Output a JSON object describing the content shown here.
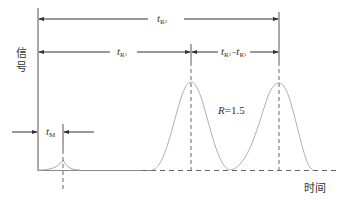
{
  "diagram": {
    "y_axis_label_line1": "信",
    "y_axis_label_line2": "号",
    "x_axis_label": "时间",
    "labels": {
      "tR2": {
        "main": "t",
        "sub": "R",
        "subsub": "2"
      },
      "tR1": {
        "main": "t",
        "sub": "R",
        "subsub": "1"
      },
      "diff": {
        "a_main": "t",
        "a_sub": "R",
        "a_subsub": "2",
        "dash": "−",
        "b_main": "t",
        "b_sub": "R",
        "b_subsub": "1"
      },
      "tM": {
        "main": "t",
        "sub": "M"
      },
      "resolution": {
        "var": "R",
        "value": "=1.5"
      }
    },
    "colors": {
      "line": "#555555",
      "peak": "#b0b0b0",
      "dashed": "#666666"
    }
  }
}
